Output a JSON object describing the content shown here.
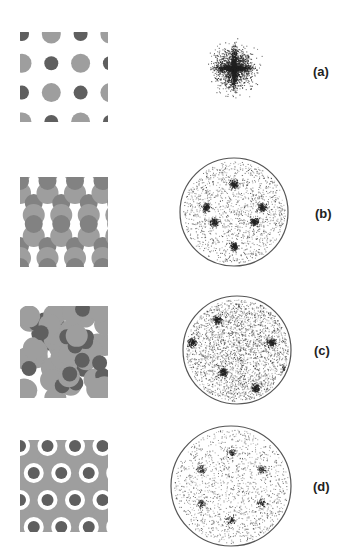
{
  "figure": {
    "panels": [
      {
        "id": "a",
        "label": "(a)",
        "pattern": {
          "x": 20,
          "y": 32,
          "w": 88,
          "h": 90,
          "type": "square-lattice-dots"
        },
        "diffraction": {
          "cx": 234,
          "cy": 68,
          "r": 0,
          "bordered": false,
          "type": "cross-star"
        },
        "label_pos": {
          "x": 313,
          "y": 64
        }
      },
      {
        "id": "b",
        "label": "(b)",
        "pattern": {
          "x": 20,
          "y": 177,
          "w": 88,
          "h": 90,
          "type": "dimer-lattice"
        },
        "diffraction": {
          "cx": 234,
          "cy": 212,
          "r": 54,
          "bordered": true,
          "type": "threefold"
        },
        "label_pos": {
          "x": 315,
          "y": 206
        }
      },
      {
        "id": "c",
        "label": "(c)",
        "pattern": {
          "x": 20,
          "y": 306,
          "w": 88,
          "h": 92,
          "type": "disordered-packing"
        },
        "diffraction": {
          "cx": 237,
          "cy": 350,
          "r": 54,
          "bordered": true,
          "type": "diffuse-sixfold"
        },
        "label_pos": {
          "x": 314,
          "y": 343
        }
      },
      {
        "id": "d",
        "label": "(d)",
        "pattern": {
          "x": 20,
          "y": 440,
          "w": 88,
          "h": 92,
          "type": "hexagonal-packing"
        },
        "diffraction": {
          "cx": 231,
          "cy": 486,
          "r": 60,
          "bordered": true,
          "type": "sixfold-peaks"
        },
        "label_pos": {
          "x": 313,
          "y": 479
        }
      }
    ],
    "colors": {
      "dark_sphere": "#5f5f5f",
      "light_sphere": "#9e9e9e",
      "mid_sphere": "#828282",
      "circle_border": "#555555",
      "speckle": "#222222"
    }
  }
}
